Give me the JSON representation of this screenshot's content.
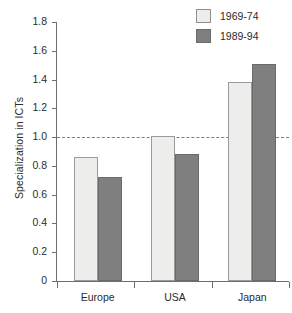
{
  "chart_data": {
    "type": "bar",
    "title": "",
    "xlabel": "",
    "ylabel": "Specialization in ICTs",
    "categories": [
      "Europe",
      "USA",
      "Japan"
    ],
    "series": [
      {
        "name": "1969-74",
        "color": "#ededeb",
        "values": [
          0.86,
          1.01,
          1.38
        ]
      },
      {
        "name": "1989-94",
        "color": "#7f7f7f",
        "values": [
          0.72,
          0.88,
          1.51
        ]
      }
    ],
    "ylim": [
      0,
      1.8
    ],
    "ytick_labels": [
      "0",
      "0.2",
      "0.4",
      "0.6",
      "0.8",
      "1.0",
      "1.2",
      "1.4",
      "1.6",
      "1.8"
    ],
    "ytick_values": [
      0,
      0.2,
      0.4,
      0.6,
      0.8,
      1.0,
      1.2,
      1.4,
      1.6,
      1.8
    ],
    "grid": false,
    "reference_line": {
      "value": 1.0,
      "style": "dashed",
      "color": "#7d7d7d"
    },
    "legend_position": "top-right"
  }
}
